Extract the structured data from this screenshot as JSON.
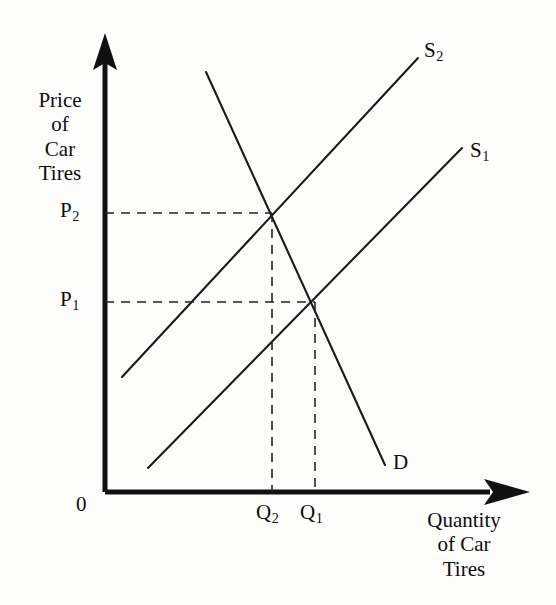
{
  "figure": {
    "background_color": "#fdfdfc",
    "ink_color": "#111111"
  },
  "axes": {
    "y_axis_label": "Price\nof\nCar\nTires",
    "x_axis_label": "Quantity\nof Car\nTires",
    "origin_label": "0"
  },
  "price_ticks": [
    {
      "label": "P",
      "sub": "2"
    },
    {
      "label": "P",
      "sub": "1"
    }
  ],
  "quantity_ticks": [
    {
      "label": "Q",
      "sub": "2"
    },
    {
      "label": "Q",
      "sub": "1"
    }
  ],
  "curve_labels": [
    {
      "label": "S",
      "sub": "2"
    },
    {
      "label": "S",
      "sub": "1"
    },
    {
      "label": "D",
      "sub": ""
    }
  ],
  "chart_data": {
    "type": "line",
    "title": "",
    "xlabel": "Quantity of Car Tires",
    "ylabel": "Price of Car Tires",
    "grid": false,
    "legend": "inline-curve-labels",
    "axis_style": "arrow-headed open axes, no numeric scale",
    "xlim": [
      0,
      100
    ],
    "ylim": [
      0,
      100
    ],
    "annotations": [
      "P2 and P1 marked by dashed horizontal guide lines from price axis",
      "Q2 and Q1 marked by dashed vertical guide lines down to quantity axis",
      "Supply shifts left from S1 to S2, raising price from P1 to P2 and reducing quantity from Q1 to Q2"
    ],
    "series": [
      {
        "name": "S2",
        "role": "supply-shifted",
        "slope": "upward",
        "points": [
          {
            "x": 4.0,
            "y": 25.4
          },
          {
            "x": 73.9,
            "y": 96.0
          }
        ]
      },
      {
        "name": "S1",
        "role": "supply-original",
        "slope": "upward",
        "points": [
          {
            "x": 10.2,
            "y": 5.3
          },
          {
            "x": 84.3,
            "y": 76.1
          }
        ]
      },
      {
        "name": "D",
        "role": "demand",
        "slope": "downward",
        "points": [
          {
            "x": 23.9,
            "y": 93.0
          },
          {
            "x": 66.2,
            "y": 6.0
          }
        ]
      }
    ],
    "equilibria": [
      {
        "name": "E2",
        "price_label": "P2",
        "quantity_label": "Q2",
        "x": 39.5,
        "y": 61.7,
        "curves": [
          "S2",
          "D"
        ]
      },
      {
        "name": "E1",
        "price_label": "P1",
        "quantity_label": "Q1",
        "x": 49.6,
        "y": 42.1,
        "curves": [
          "S1",
          "D"
        ]
      }
    ]
  }
}
